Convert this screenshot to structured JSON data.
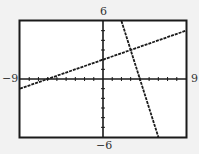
{
  "chart_data": {
    "type": "line",
    "title": "",
    "xlabel": "",
    "ylabel": "",
    "xlim": [
      -9,
      9
    ],
    "ylim": [
      -6,
      6
    ],
    "grid": false,
    "tick_step": 1,
    "axis_labels": {
      "xmin": "−9",
      "xmax": "9",
      "ymin": "−6",
      "ymax": "6"
    },
    "series": [
      {
        "name": "line-1",
        "equation_estimate": "y = x/3 + 2",
        "x": [
          -9,
          9
        ],
        "y": [
          -1,
          5
        ]
      },
      {
        "name": "line-2",
        "equation_estimate": "y = -3x + 12",
        "x": [
          2,
          6
        ],
        "y": [
          6,
          -6
        ]
      }
    ],
    "intersection_estimate": {
      "x": 3,
      "y": 3
    },
    "colors": {
      "line": "#1a1a1a",
      "frame": "#1a1a1a",
      "background": "#ffffff",
      "page": "#f2f2f2"
    }
  }
}
